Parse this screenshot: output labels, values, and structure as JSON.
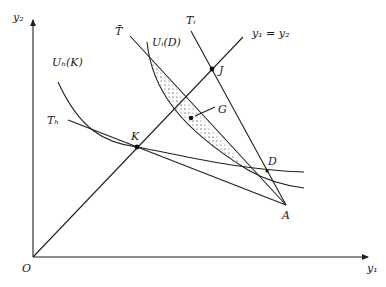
{
  "figure": {
    "axes": {
      "x_label": "y₁",
      "y_label": "y₂",
      "origin_label": "O"
    },
    "diagonal_label": "y₁ = y₂",
    "lines": {
      "t_bar": "T̄",
      "t_i": "Tᵢ",
      "t_h": "Tₕ"
    },
    "curves": {
      "u_h": "Uₕ(K)",
      "u_i": "Uᵢ(D)"
    },
    "points": {
      "J": "J",
      "K": "K",
      "G": "G",
      "D": "D",
      "A": "A"
    },
    "colors": {
      "stroke": "#1f1f1f",
      "shading_dots": "#555555",
      "background": "#ffffff"
    }
  }
}
